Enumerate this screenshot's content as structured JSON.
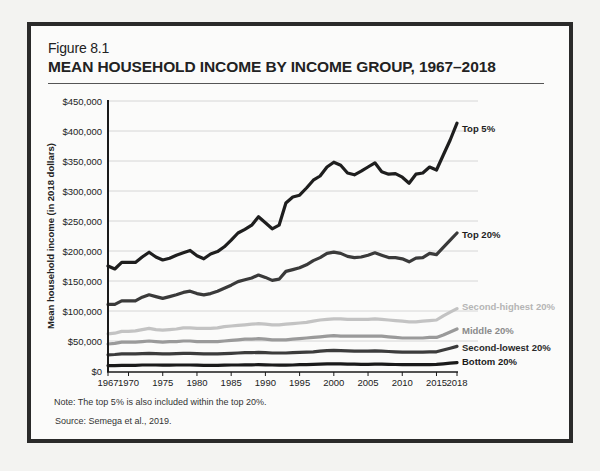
{
  "figure": {
    "number": "Figure 8.1",
    "title": "MEAN HOUSEHOLD INCOME BY INCOME GROUP, 1967–2018",
    "note": "Note: The top 5% is also included within the top 20%.",
    "source": "Source: Semega et al., 2019."
  },
  "chart_data": {
    "type": "line",
    "title": "MEAN HOUSEHOLD INCOME BY INCOME GROUP, 1967–2018",
    "xlabel": "",
    "ylabel": "Mean household income (in 2018 dollars)",
    "ylim": [
      0,
      450000
    ],
    "xlim": [
      1967,
      2018
    ],
    "grid": true,
    "legend_position": "inline-right",
    "y_ticks": [
      "$0",
      "$50,000",
      "$100,000",
      "$150,000",
      "$200,000",
      "$250,000",
      "$300,000",
      "$350,000",
      "$400,000",
      "$450,000"
    ],
    "x_ticks": [
      "1967",
      "1970",
      "1975",
      "1980",
      "1985",
      "1990",
      "1995",
      "2000",
      "2005",
      "2010",
      "2015",
      "2018"
    ],
    "x": [
      1967,
      1968,
      1969,
      1970,
      1971,
      1972,
      1973,
      1974,
      1975,
      1976,
      1977,
      1978,
      1979,
      1980,
      1981,
      1982,
      1983,
      1984,
      1985,
      1986,
      1987,
      1988,
      1989,
      1990,
      1991,
      1992,
      1993,
      1994,
      1995,
      1996,
      1997,
      1998,
      1999,
      2000,
      2001,
      2002,
      2003,
      2004,
      2005,
      2006,
      2007,
      2008,
      2009,
      2010,
      2011,
      2012,
      2013,
      2014,
      2015,
      2016,
      2017,
      2018
    ],
    "series": [
      {
        "name": "Top 5%",
        "color": "#1e1e1e",
        "label_color": "#1e1e1e",
        "values": [
          175000,
          170000,
          181000,
          181000,
          181000,
          190000,
          198000,
          190000,
          185000,
          188000,
          193000,
          197000,
          201000,
          192000,
          187000,
          195000,
          199000,
          207000,
          218000,
          230000,
          236000,
          243000,
          257000,
          247000,
          237000,
          243000,
          280000,
          290000,
          293000,
          305000,
          318000,
          325000,
          340000,
          348000,
          343000,
          330000,
          327000,
          333000,
          340000,
          347000,
          332000,
          328000,
          329000,
          323000,
          313000,
          328000,
          330000,
          340000,
          335000,
          360000,
          385000,
          413000
        ]
      },
      {
        "name": "Top 20%",
        "color": "#3a3a3a",
        "label_color": "#1e1e1e",
        "values": [
          111000,
          111000,
          117000,
          117000,
          117000,
          123000,
          127000,
          124000,
          121000,
          124000,
          127000,
          131000,
          133000,
          129000,
          127000,
          129000,
          133000,
          138000,
          143000,
          149000,
          152000,
          155000,
          160000,
          156000,
          151000,
          153000,
          166000,
          169000,
          172000,
          177000,
          184000,
          189000,
          196000,
          198000,
          196000,
          191000,
          189000,
          190000,
          193000,
          197000,
          193000,
          189000,
          189000,
          187000,
          182000,
          188000,
          189000,
          196000,
          194000,
          206000,
          218000,
          230000
        ]
      },
      {
        "name": "Second-highest 20%",
        "color": "#c3c3c3",
        "label_color": "#b5b5b5",
        "values": [
          62000,
          63000,
          66000,
          66000,
          67000,
          69000,
          71000,
          69000,
          68000,
          69000,
          70000,
          72000,
          72000,
          71000,
          71000,
          71000,
          72000,
          74000,
          75000,
          76000,
          77000,
          78000,
          79000,
          78000,
          77000,
          77000,
          78000,
          79000,
          80000,
          81000,
          83000,
          85000,
          86000,
          87000,
          87000,
          86000,
          86000,
          86000,
          86000,
          87000,
          86000,
          85000,
          84000,
          83000,
          82000,
          82000,
          83000,
          84000,
          85000,
          92000,
          98000,
          104000
        ]
      },
      {
        "name": "Middle 20%",
        "color": "#9a9a9a",
        "label_color": "#8a8a8a",
        "values": [
          45000,
          46000,
          48000,
          48000,
          48000,
          49000,
          50000,
          49000,
          48000,
          49000,
          49000,
          50000,
          50000,
          49000,
          49000,
          49000,
          49000,
          50000,
          51000,
          52000,
          53000,
          53000,
          54000,
          53000,
          52000,
          52000,
          52000,
          53000,
          54000,
          55000,
          56000,
          57000,
          58000,
          59000,
          58000,
          58000,
          58000,
          58000,
          58000,
          58000,
          58000,
          57000,
          56000,
          55000,
          55000,
          55000,
          55000,
          56000,
          56000,
          60000,
          65000,
          70000
        ]
      },
      {
        "name": "Second-lowest 20%",
        "color": "#3c3c3c",
        "label_color": "#2a2a2a",
        "values": [
          27000,
          27500,
          28500,
          28500,
          28500,
          29000,
          29500,
          29000,
          28500,
          28500,
          29000,
          29500,
          29500,
          29000,
          28500,
          28500,
          28500,
          29000,
          29500,
          30000,
          30500,
          30500,
          31000,
          30500,
          30000,
          30000,
          30000,
          30500,
          31000,
          31500,
          32000,
          33000,
          34000,
          34500,
          34000,
          33500,
          33000,
          33000,
          33000,
          33500,
          33000,
          32500,
          32000,
          31500,
          31500,
          31500,
          31500,
          32000,
          32000,
          35000,
          38000,
          41000
        ]
      },
      {
        "name": "Bottom 20%",
        "color": "#1a1a1a",
        "label_color": "#1a1a1a",
        "values": [
          9000,
          9000,
          9500,
          9500,
          9500,
          10000,
          10000,
          10000,
          9800,
          9800,
          10000,
          10000,
          10000,
          9800,
          9500,
          9500,
          9500,
          9800,
          10000,
          10000,
          10200,
          10300,
          10500,
          10300,
          10000,
          9800,
          9800,
          10000,
          10500,
          10700,
          11000,
          11300,
          11800,
          12000,
          11800,
          11500,
          11300,
          11200,
          11200,
          11300,
          11300,
          11000,
          10800,
          10600,
          10500,
          10500,
          10500,
          10700,
          11000,
          12000,
          13000,
          14000
        ]
      }
    ]
  }
}
